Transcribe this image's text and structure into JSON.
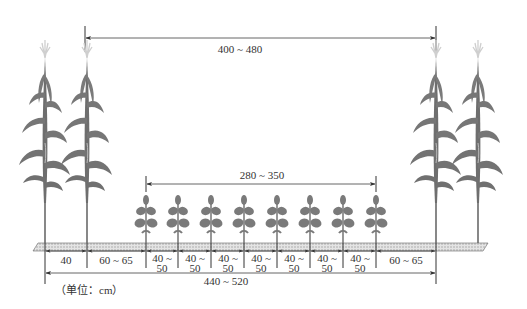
{
  "diagram": {
    "title": "",
    "unit_note": "（单位：cm）",
    "colors": {
      "plant": "#7a7a7a",
      "plant_dark": "#5f5f5f",
      "tassel": "#c8c8c8",
      "ground": "#d9d9d9",
      "line": "#333333"
    },
    "dimensions": {
      "corn_wide_row": "400 ~ 480",
      "soybean_span": "280 ~ 350",
      "total_strip": "440 ~ 520",
      "corn_narrow_row": "40",
      "corn_to_soy_left": "60 ~ 65",
      "corn_to_soy_right": "60 ~ 65",
      "soy_row_spacing": [
        {
          "l1": "40 ~",
          "l2": "50"
        },
        {
          "l1": "40 ~",
          "l2": "50"
        },
        {
          "l1": "40 ~",
          "l2": "50"
        },
        {
          "l1": "40 ~",
          "l2": "50"
        },
        {
          "l1": "40 ~",
          "l2": "50"
        },
        {
          "l1": "40 ~",
          "l2": "50"
        },
        {
          "l1": "40 ~",
          "l2": "50"
        }
      ]
    },
    "plants": {
      "corn_left": [
        45,
        87
      ],
      "corn_right": [
        436,
        478
      ],
      "soybean": [
        146,
        178,
        211,
        244,
        277,
        310,
        343,
        376
      ]
    }
  }
}
